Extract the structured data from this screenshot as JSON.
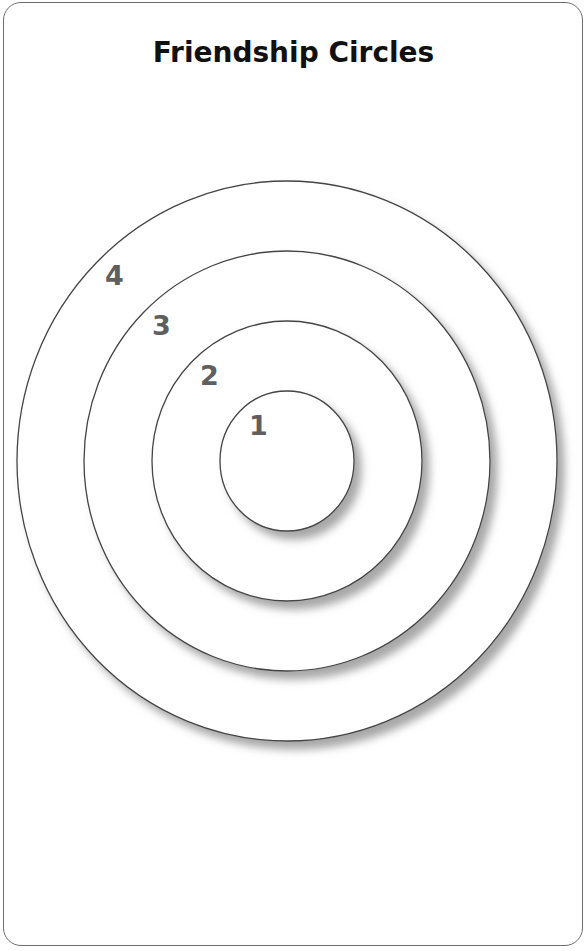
{
  "diagram": {
    "title": "Friendship Circles",
    "rings": [
      {
        "label": "4",
        "rx": 270,
        "ry": 280
      },
      {
        "label": "3",
        "rx": 203,
        "ry": 210
      },
      {
        "label": "2",
        "rx": 135,
        "ry": 140
      },
      {
        "label": "1",
        "rx": 67,
        "ry": 70
      }
    ],
    "center": {
      "x": 287,
      "y": 461
    },
    "colors": {
      "stroke": "#444444",
      "label": "#5f5f5f",
      "title": "#111111",
      "shadow": "#9a9a9a"
    }
  }
}
